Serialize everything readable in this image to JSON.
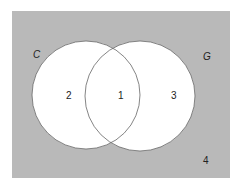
{
  "diagram": {
    "type": "venn",
    "background_color": "#b9b9b9",
    "circle_fill": "#ffffff",
    "circle_stroke": "#555555",
    "sets": [
      {
        "name": "C"
      },
      {
        "name": "G"
      }
    ],
    "regions": [
      {
        "label": "2",
        "description": "C only"
      },
      {
        "label": "1",
        "description": "C and G"
      },
      {
        "label": "3",
        "description": "G only"
      },
      {
        "label": "4",
        "description": "neither"
      }
    ]
  }
}
